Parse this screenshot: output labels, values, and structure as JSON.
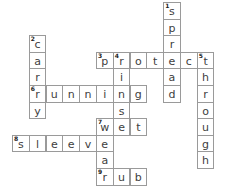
{
  "puzzle": {
    "grid_origin": {
      "x": 12,
      "y": 2
    },
    "cell_pitch": {
      "x": 16.8,
      "y": 16.6
    },
    "cells": [
      {
        "col": 9,
        "row": 0,
        "letter": "s",
        "number": "1"
      },
      {
        "col": 9,
        "row": 1,
        "letter": "p"
      },
      {
        "col": 9,
        "row": 2,
        "letter": "r"
      },
      {
        "col": 1,
        "row": 2,
        "letter": "c",
        "number": "2"
      },
      {
        "col": 1,
        "row": 3,
        "letter": "a"
      },
      {
        "col": 5,
        "row": 3,
        "letter": "p",
        "number": "3"
      },
      {
        "col": 6,
        "row": 3,
        "letter": "r",
        "number": "4"
      },
      {
        "col": 7,
        "row": 3,
        "letter": "o"
      },
      {
        "col": 8,
        "row": 3,
        "letter": "t"
      },
      {
        "col": 9,
        "row": 3,
        "letter": "e"
      },
      {
        "col": 10,
        "row": 3,
        "letter": "c"
      },
      {
        "col": 11,
        "row": 3,
        "letter": "t",
        "number": "5"
      },
      {
        "col": 1,
        "row": 4,
        "letter": "r"
      },
      {
        "col": 6,
        "row": 4,
        "letter": "i"
      },
      {
        "col": 9,
        "row": 4,
        "letter": "a"
      },
      {
        "col": 11,
        "row": 4,
        "letter": "h"
      },
      {
        "col": 1,
        "row": 5,
        "letter": "r",
        "number": "6"
      },
      {
        "col": 2,
        "row": 5,
        "letter": "u"
      },
      {
        "col": 3,
        "row": 5,
        "letter": "n"
      },
      {
        "col": 4,
        "row": 5,
        "letter": "n"
      },
      {
        "col": 5,
        "row": 5,
        "letter": "i"
      },
      {
        "col": 6,
        "row": 5,
        "letter": "n"
      },
      {
        "col": 7,
        "row": 5,
        "letter": "g"
      },
      {
        "col": 9,
        "row": 5,
        "letter": "d"
      },
      {
        "col": 11,
        "row": 5,
        "letter": "r"
      },
      {
        "col": 1,
        "row": 6,
        "letter": "y"
      },
      {
        "col": 6,
        "row": 6,
        "letter": "s"
      },
      {
        "col": 11,
        "row": 6,
        "letter": "o"
      },
      {
        "col": 5,
        "row": 7,
        "letter": "w",
        "number": "7"
      },
      {
        "col": 6,
        "row": 7,
        "letter": "e"
      },
      {
        "col": 7,
        "row": 7,
        "letter": "t"
      },
      {
        "col": 11,
        "row": 7,
        "letter": "u"
      },
      {
        "col": 0,
        "row": 8,
        "letter": "s",
        "number": "8"
      },
      {
        "col": 1,
        "row": 8,
        "letter": "l"
      },
      {
        "col": 2,
        "row": 8,
        "letter": "e"
      },
      {
        "col": 3,
        "row": 8,
        "letter": "e"
      },
      {
        "col": 4,
        "row": 8,
        "letter": "v"
      },
      {
        "col": 5,
        "row": 8,
        "letter": "e"
      },
      {
        "col": 11,
        "row": 8,
        "letter": "g"
      },
      {
        "col": 5,
        "row": 9,
        "letter": "a"
      },
      {
        "col": 11,
        "row": 9,
        "letter": "h"
      },
      {
        "col": 5,
        "row": 10,
        "letter": "r",
        "number": "9"
      },
      {
        "col": 6,
        "row": 10,
        "letter": "u"
      },
      {
        "col": 7,
        "row": 10,
        "letter": "b"
      }
    ],
    "words": {
      "across": [
        {
          "number": "3",
          "answer": "protect"
        },
        {
          "number": "6",
          "answer": "running"
        },
        {
          "number": "7",
          "answer": "wet"
        },
        {
          "number": "8",
          "answer": "sleeve"
        },
        {
          "number": "9",
          "answer": "rub"
        }
      ],
      "down": [
        {
          "number": "1",
          "answer": "spread"
        },
        {
          "number": "2",
          "answer": "carry"
        },
        {
          "number": "4",
          "answer": "rinse"
        },
        {
          "number": "5",
          "answer": "through"
        },
        {
          "number": "7",
          "answer": "wear"
        }
      ]
    },
    "colors": {
      "border": "#9a9a9a",
      "letter": "#404040",
      "background": "#ffffff"
    }
  }
}
